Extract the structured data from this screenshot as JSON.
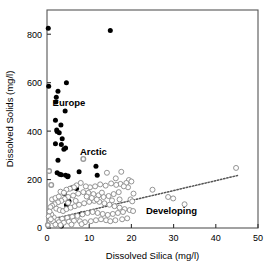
{
  "chart_data": {
    "type": "scatter",
    "title": "",
    "xlabel": "Dissolved Silica (mg/l)",
    "ylabel": "Dissolved Solids (mg/l)",
    "xlim": [
      0,
      50
    ],
    "ylim": [
      0,
      900
    ],
    "xticks": [
      0,
      10,
      20,
      30,
      40,
      50
    ],
    "yticks": [
      0,
      200,
      400,
      600,
      800
    ],
    "xtick_labels": [
      "0",
      "10",
      "20",
      "30",
      "40",
      "50"
    ],
    "ytick_labels": [
      "0",
      "200",
      "400",
      "600",
      "800"
    ],
    "grid": false,
    "legend_position": "in-plot-annotations",
    "annotations": [
      {
        "text": "Europe",
        "x": 5.2,
        "y": 505
      },
      {
        "text": "Arctic",
        "x": 11.0,
        "y": 300
      },
      {
        "text": "Developing",
        "x": 29.5,
        "y": 58
      }
    ],
    "series": [
      {
        "name": "Europe",
        "marker": "filled-circle",
        "color": "#000000",
        "points": [
          [
            0.3,
            825
          ],
          [
            15.0,
            815
          ],
          [
            0.4,
            585
          ],
          [
            4.6,
            600
          ],
          [
            2.6,
            565
          ],
          [
            2.2,
            540
          ],
          [
            2.1,
            520
          ],
          [
            4.3,
            483
          ],
          [
            2.0,
            445
          ],
          [
            3.3,
            425
          ],
          [
            2.3,
            405
          ],
          [
            2.4,
            398
          ],
          [
            2.9,
            393
          ],
          [
            3.6,
            368
          ],
          [
            4.4,
            330
          ],
          [
            3.4,
            345
          ],
          [
            2.0,
            348
          ],
          [
            4.0,
            325
          ],
          [
            2.6,
            280
          ],
          [
            2.4,
            228
          ],
          [
            3.0,
            222
          ],
          [
            3.4,
            220
          ],
          [
            4.4,
            218
          ],
          [
            5.0,
            215
          ],
          [
            4.9,
            212
          ],
          [
            7.6,
            232
          ],
          [
            11.6,
            255
          ],
          [
            11.9,
            218
          ],
          [
            5.8,
            165
          ],
          [
            4.1,
            142
          ],
          [
            6.8,
            168
          ],
          [
            7.0,
            163
          ],
          [
            5.2,
            110
          ],
          [
            4.6,
            95
          ],
          [
            8.1,
            58
          ],
          [
            3.4,
            8
          ]
        ]
      },
      {
        "name": "Arctic",
        "marker": "gray-diamond",
        "color": "#999999",
        "points": [
          [
            8.6,
            285
          ],
          [
            0.5,
            235
          ],
          [
            1.0,
            178
          ],
          [
            0.2,
            12
          ]
        ]
      },
      {
        "name": "Developing",
        "marker": "open-circle",
        "color": "#888888",
        "points": [
          [
            44.8,
            248
          ],
          [
            17.6,
            232
          ],
          [
            14.2,
            228
          ],
          [
            16.3,
            205
          ],
          [
            19.4,
            198
          ],
          [
            20.0,
            192
          ],
          [
            18.8,
            186
          ],
          [
            17.4,
            182
          ],
          [
            16.4,
            178
          ],
          [
            15.2,
            184
          ],
          [
            13.9,
            175
          ],
          [
            12.6,
            180
          ],
          [
            11.4,
            172
          ],
          [
            10.2,
            168
          ],
          [
            9.2,
            172
          ],
          [
            8.0,
            186
          ],
          [
            7.0,
            176
          ],
          [
            6.4,
            168
          ],
          [
            5.4,
            162
          ],
          [
            4.6,
            158
          ],
          [
            19.2,
            168
          ],
          [
            18.2,
            172
          ],
          [
            25.0,
            158
          ],
          [
            28.7,
            128
          ],
          [
            29.9,
            122
          ],
          [
            32.6,
            98
          ],
          [
            20.5,
            142
          ],
          [
            17.0,
            148
          ],
          [
            15.8,
            140
          ],
          [
            14.6,
            132
          ],
          [
            13.4,
            128
          ],
          [
            12.2,
            135
          ],
          [
            11.0,
            140
          ],
          [
            9.8,
            145
          ],
          [
            8.6,
            148
          ],
          [
            7.4,
            142
          ],
          [
            6.2,
            134
          ],
          [
            5.0,
            128
          ],
          [
            4.2,
            120
          ],
          [
            3.4,
            112
          ],
          [
            2.6,
            106
          ],
          [
            1.8,
            98
          ],
          [
            1.2,
            92
          ],
          [
            0.8,
            86
          ],
          [
            2.2,
            80
          ],
          [
            3.0,
            74
          ],
          [
            3.8,
            70
          ],
          [
            4.6,
            78
          ],
          [
            5.6,
            84
          ],
          [
            6.6,
            90
          ],
          [
            7.6,
            96
          ],
          [
            8.8,
            102
          ],
          [
            10.0,
            108
          ],
          [
            11.2,
            112
          ],
          [
            12.4,
            108
          ],
          [
            13.6,
            102
          ],
          [
            14.8,
            96
          ],
          [
            16.0,
            90
          ],
          [
            17.2,
            84
          ],
          [
            18.4,
            78
          ],
          [
            19.6,
            74
          ],
          [
            20.4,
            70
          ],
          [
            18.0,
            66
          ],
          [
            16.8,
            62
          ],
          [
            15.6,
            58
          ],
          [
            14.4,
            54
          ],
          [
            13.2,
            58
          ],
          [
            12.0,
            62
          ],
          [
            10.8,
            66
          ],
          [
            9.6,
            62
          ],
          [
            8.4,
            56
          ],
          [
            7.2,
            50
          ],
          [
            6.0,
            46
          ],
          [
            4.8,
            42
          ],
          [
            3.6,
            38
          ],
          [
            2.4,
            34
          ],
          [
            1.6,
            44
          ],
          [
            1.0,
            56
          ],
          [
            0.6,
            68
          ],
          [
            1.4,
            28
          ],
          [
            2.8,
            24
          ],
          [
            4.0,
            22
          ],
          [
            5.2,
            26
          ],
          [
            6.4,
            30
          ],
          [
            7.8,
            28
          ],
          [
            9.0,
            24
          ],
          [
            10.4,
            28
          ],
          [
            11.6,
            32
          ],
          [
            12.8,
            36
          ],
          [
            14.0,
            32
          ],
          [
            15.0,
            28
          ],
          [
            16.2,
            32
          ],
          [
            17.8,
            36
          ],
          [
            19.0,
            40
          ],
          [
            2.0,
            14
          ],
          [
            3.2,
            12
          ],
          [
            5.8,
            14
          ],
          [
            8.2,
            16
          ],
          [
            1.2,
            118
          ],
          [
            2.0,
            124
          ],
          [
            2.8,
            130
          ],
          [
            3.2,
            150
          ],
          [
            4.0,
            146
          ],
          [
            5.0,
            104
          ],
          [
            6.8,
            112
          ],
          [
            9.4,
            130
          ],
          [
            10.6,
            124
          ],
          [
            11.8,
            118
          ],
          [
            13.0,
            146
          ],
          [
            19.8,
            118
          ],
          [
            20.2,
            110
          ],
          [
            17.2,
            118
          ],
          [
            15.4,
            114
          ],
          [
            0.4,
            48
          ],
          [
            0.9,
            36
          ]
        ]
      }
    ],
    "trendline": {
      "style": "dotted",
      "color": "#555555",
      "x_start": 2.0,
      "y_start": 40,
      "x_end": 45.5,
      "y_end": 218
    }
  }
}
